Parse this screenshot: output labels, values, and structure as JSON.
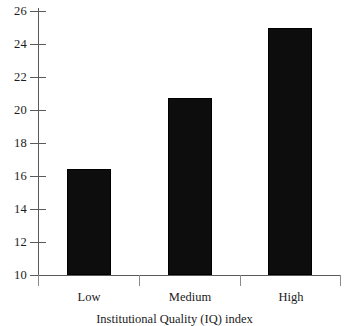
{
  "chart_data": {
    "type": "bar",
    "title": "",
    "subtitle": "",
    "categories": [
      "Low",
      "Medium",
      "High"
    ],
    "values": [
      16.4,
      20.7,
      25.0
    ],
    "xlabel": "Institutional Quality (IQ) index",
    "ylabel": "",
    "ylim": [
      10,
      26
    ],
    "yticks": [
      10,
      12,
      14,
      16,
      18,
      20,
      22,
      24,
      26
    ],
    "ytick_labels": [
      "10",
      "12",
      "14",
      "16",
      "18",
      "20",
      "22",
      "24",
      "26"
    ],
    "grid": false,
    "legend": null,
    "legend_position": "none",
    "bar_color": "#0d0d0d",
    "axis_color": "#5a5a5a",
    "background_color": "#ffffff"
  },
  "axis": {
    "y_tick_labels": [
      "26",
      "24",
      "22",
      "20",
      "18",
      "16",
      "14",
      "12",
      "10"
    ],
    "x_tick_labels": [
      "Low",
      "Medium",
      "High"
    ],
    "x_title": "Institutional Quality (IQ) index"
  }
}
